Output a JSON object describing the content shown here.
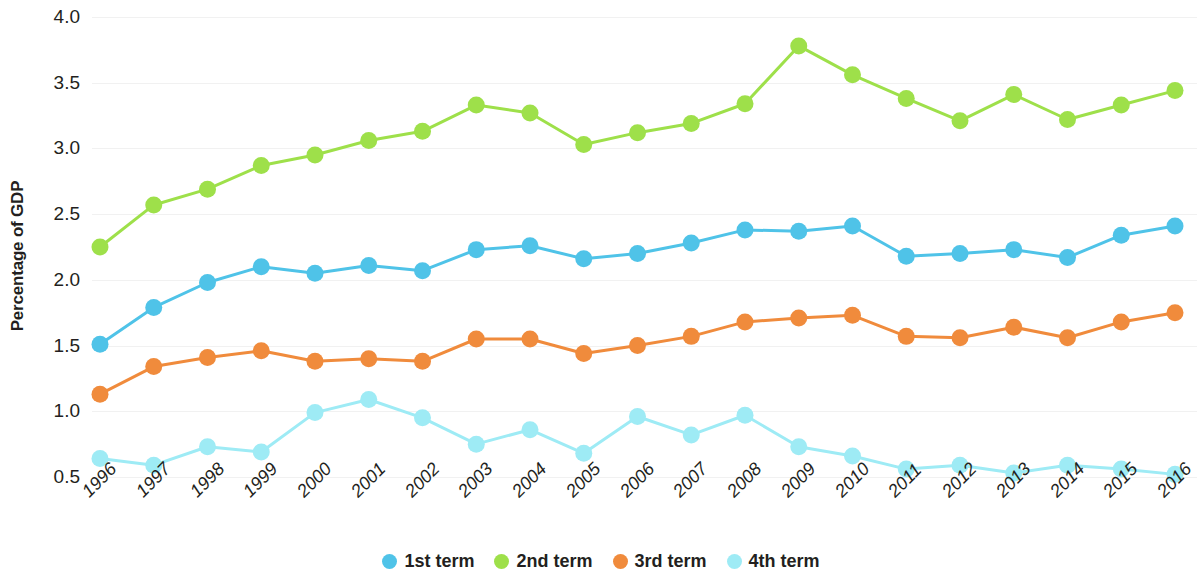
{
  "chart_data": {
    "type": "line",
    "title": "",
    "subtitle": "",
    "xlabel": "",
    "ylabel": "Percentage of GDP",
    "ylim": [
      0.5,
      4.0
    ],
    "ytick_labels": [
      "4.0",
      "3.5",
      "3.0",
      "2.5",
      "2.0",
      "1.5",
      "1.0",
      "0.5"
    ],
    "ytick_values": [
      4.0,
      3.5,
      3.0,
      2.5,
      2.0,
      1.5,
      1.0,
      0.5
    ],
    "grid": true,
    "legend_position": "bottom",
    "markers": true,
    "categories": [
      "1996",
      "1997",
      "1998",
      "1999",
      "2000",
      "2001",
      "2002",
      "2003",
      "2004",
      "2005",
      "2006",
      "2007",
      "2008",
      "2009",
      "2010",
      "2011",
      "2012",
      "2013",
      "2014",
      "2015",
      "2016"
    ],
    "series": [
      {
        "name": "1st term",
        "color": "#4FC3E8",
        "values": [
          1.51,
          1.79,
          1.98,
          2.1,
          2.05,
          2.11,
          2.07,
          2.23,
          2.26,
          2.16,
          2.2,
          2.28,
          2.38,
          2.37,
          2.41,
          2.18,
          2.2,
          2.23,
          2.17,
          2.34,
          2.41
        ]
      },
      {
        "name": "2nd term",
        "color": "#9EE04A",
        "values": [
          2.25,
          2.57,
          2.69,
          2.87,
          2.95,
          3.06,
          3.13,
          3.33,
          3.27,
          3.03,
          3.12,
          3.19,
          3.34,
          3.78,
          3.56,
          3.38,
          3.21,
          3.41,
          3.22,
          3.33,
          3.44
        ]
      },
      {
        "name": "3rd term",
        "color": "#F08B3C",
        "values": [
          1.13,
          1.34,
          1.41,
          1.46,
          1.38,
          1.4,
          1.38,
          1.55,
          1.55,
          1.44,
          1.5,
          1.57,
          1.68,
          1.71,
          1.73,
          1.57,
          1.56,
          1.64,
          1.56,
          1.68,
          1.75
        ]
      },
      {
        "name": "4th term",
        "color": "#9EEBF5",
        "values": [
          0.64,
          0.59,
          0.73,
          0.69,
          0.99,
          1.09,
          0.95,
          0.75,
          0.86,
          0.68,
          0.96,
          0.82,
          0.97,
          0.73,
          0.66,
          0.56,
          0.59,
          0.53,
          0.59,
          0.56,
          0.52
        ]
      }
    ],
    "legend": [
      {
        "label": "1st term",
        "color": "#4FC3E8"
      },
      {
        "label": "2nd term",
        "color": "#9EE04A"
      },
      {
        "label": "3rd term",
        "color": "#F08B3C"
      },
      {
        "label": "4th term",
        "color": "#9EEBF5"
      }
    ]
  }
}
